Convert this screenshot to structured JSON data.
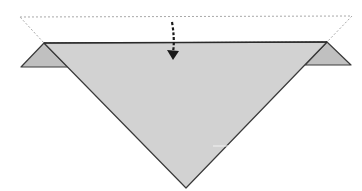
{
  "diagram": {
    "type": "origami-fold-step",
    "colors": {
      "paper": "#d2d2d2",
      "flap": "#c0c0c0",
      "outline": "#3a3a3a",
      "dashed_guide": "#a8a8a8",
      "arrow": "#1a1a1a",
      "background": "#ffffff"
    },
    "elements": {
      "dashed_outline": {
        "points": "20,17 352,16 327,42 44,43"
      },
      "main_triangle": {
        "points": "44,43 327,42 186,188"
      },
      "left_flap": {
        "points": "44,43 21,67 68,67"
      },
      "right_flap": {
        "points": "327,42 351,65 305,65"
      },
      "fold_arrow": {
        "path": "M172,22 Q175,40 173,52",
        "head": "168,50 178,51 173,59"
      }
    }
  }
}
